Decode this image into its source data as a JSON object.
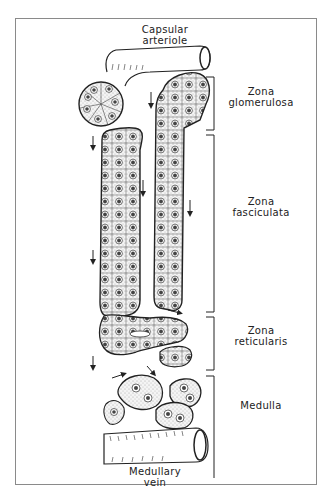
{
  "figure": {
    "labels": {
      "capsular_arteriole": [
        "Capsular",
        "arteriole"
      ],
      "medullary_vein": [
        "Medullary",
        "vein"
      ]
    },
    "zones": [
      {
        "id": "glomerulosa",
        "line1": "Zona",
        "line2": "glomerulosa"
      },
      {
        "id": "fasciculata",
        "line1": "Zona",
        "line2": "fasciculata"
      },
      {
        "id": "reticularis",
        "line1": "Zona",
        "line2": "reticularis"
      },
      {
        "id": "medulla",
        "line1": "Medulla",
        "line2": ""
      }
    ],
    "colors": {
      "ink": "#222222",
      "frame": "#8a8a8a",
      "stipple": "#cfcfcf",
      "nucleus": "#444444"
    }
  }
}
